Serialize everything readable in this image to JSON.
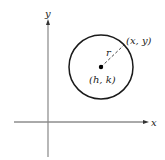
{
  "diagram": {
    "type": "circle-standard-form",
    "axes": {
      "x_label": "x",
      "y_label": "y"
    },
    "circle": {
      "center_label": "(h, k)",
      "point_label": "(x, y)",
      "radius_label": "r"
    },
    "colors": {
      "axis": "#555555",
      "circle": "#1a1a1a",
      "text": "#222222"
    }
  }
}
